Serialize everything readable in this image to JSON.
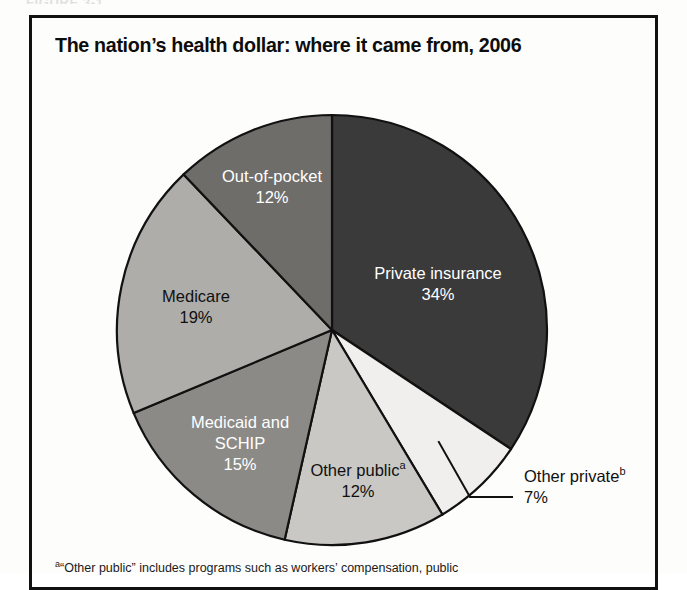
{
  "figure": {
    "header_label": "FIGURE 3-1",
    "title": "The nation’s health dollar: where it came from, 2006"
  },
  "footnote": {
    "marker": "a",
    "text": "“Other public” includes programs such as workers’ compensation, public"
  },
  "colors": {
    "private_insurance": "#3a3a3a",
    "other_private": "#f0efed",
    "other_public": "#c9c8c5",
    "medicaid_schip": "#8b8a87",
    "medicare": "#aeadaa",
    "out_of_pocket": "#6e6d6a",
    "outline": "#111111",
    "label_light": "#ffffff",
    "label_dark": "#101010"
  },
  "chart_data": {
    "type": "pie",
    "title": "The nation’s health dollar: where it came from, 2006",
    "unit": "percent",
    "total": 99,
    "start_angle_deg": 0,
    "direction": "clockwise",
    "legend": "none",
    "labels_inside_slices": true,
    "categories": [
      "Private insurance",
      "Other private",
      "Other public",
      "Medicaid and SCHIP",
      "Medicare",
      "Out-of-pocket"
    ],
    "values": [
      34,
      7,
      12,
      15,
      19,
      12
    ],
    "slices": [
      {
        "name": "Private insurance",
        "label": "Private insurance",
        "value": 34,
        "value_label": "34%",
        "footnote_marker": "",
        "color": "#3a3a3a",
        "text_color": "light",
        "label_placement": "inside",
        "label_x": 438,
        "label_y": 275
      },
      {
        "name": "Other private",
        "label": "Other private",
        "value": 7,
        "value_label": "7%",
        "footnote_marker": "b",
        "color": "#f0efed",
        "text_color": "dark",
        "label_placement": "callout",
        "label_x": 524,
        "label_y": 478
      },
      {
        "name": "Other public",
        "label": "Other public",
        "value": 12,
        "value_label": "12%",
        "footnote_marker": "a",
        "color": "#c9c8c5",
        "text_color": "dark",
        "label_placement": "inside",
        "label_x": 358,
        "label_y": 472
      },
      {
        "name": "Medicaid and SCHIP",
        "label": "Medicaid and SCHIP",
        "label_line_1": "Medicaid and",
        "label_line_2": "SCHIP",
        "value": 15,
        "value_label": "15%",
        "footnote_marker": "",
        "color": "#8b8a87",
        "text_color": "light",
        "label_placement": "inside",
        "label_x": 240,
        "label_y": 424
      },
      {
        "name": "Medicare",
        "label": "Medicare",
        "value": 19,
        "value_label": "19%",
        "footnote_marker": "",
        "color": "#aeadaa",
        "text_color": "dark",
        "label_placement": "inside",
        "label_x": 196,
        "label_y": 298
      },
      {
        "name": "Out-of-pocket",
        "label": "Out-of-pocket",
        "value": 12,
        "value_label": "12%",
        "footnote_marker": "",
        "color": "#6e6d6a",
        "text_color": "light",
        "label_placement": "inside",
        "label_x": 272,
        "label_y": 178
      }
    ],
    "geometry": {
      "center_x": 332,
      "center_y": 330,
      "radius": 215
    }
  }
}
